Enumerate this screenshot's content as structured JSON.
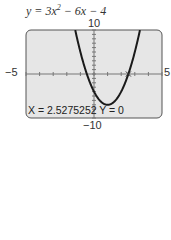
{
  "chart_data": {
    "type": "line",
    "function": "y = 3x^2 - 6x - 4",
    "xlim": [
      -5,
      5
    ],
    "ylim": [
      -10,
      10
    ],
    "x_tick_labels": {
      "min": "−5",
      "max": "5"
    },
    "y_tick_labels": {
      "max": "10",
      "min": "−10"
    },
    "x_scale": 1,
    "y_scale": 1,
    "grid": false,
    "trace": {
      "x": "2.5275252",
      "y": "0"
    },
    "series": [
      {
        "name": "y = 3x^2 - 6x - 4",
        "x": [
          -1.5,
          -1,
          -0.5,
          0,
          0.5,
          1,
          1.5,
          2,
          2.5,
          3,
          3.5
        ],
        "y": [
          11.75,
          5,
          -0.25,
          -4,
          -6.25,
          -7,
          -6.25,
          -4,
          -0.25,
          5,
          11.75
        ]
      }
    ]
  },
  "equation": {
    "prefix": "y = 3x",
    "exp": "2",
    "suffix": " − 6x − 4"
  },
  "axes": {
    "ymax": "10",
    "ymin": "−10",
    "xmin": "−5",
    "xmax": "5"
  },
  "readout": {
    "text": "X = 2.5275252   Y = 0"
  },
  "colors": {
    "screen": "#e6e6e6",
    "curve": "#1a1a1a",
    "border": "#555555"
  }
}
